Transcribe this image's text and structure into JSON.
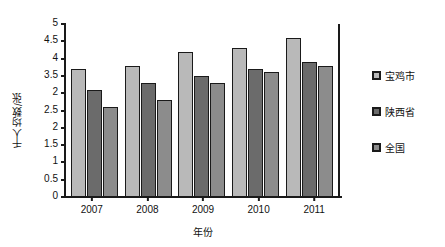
{
  "chart_data": {
    "type": "bar",
    "title": "",
    "xlabel": "年份",
    "ylabel": "千人均数/张",
    "categories": [
      "2007",
      "2008",
      "2009",
      "2010",
      "2011"
    ],
    "series": [
      {
        "name": "宝鸡市",
        "color": "#b9b9b9",
        "values": [
          3.7,
          3.8,
          4.2,
          4.3,
          4.6
        ]
      },
      {
        "name": "陕西省",
        "color": "#6b6b6b",
        "values": [
          3.1,
          3.3,
          3.5,
          3.7,
          3.9
        ]
      },
      {
        "name": "全国",
        "color": "#8c8c8c",
        "values": [
          2.6,
          2.8,
          3.3,
          3.6,
          3.8
        ]
      }
    ],
    "ylim": [
      0,
      5
    ],
    "ytick_values": [
      5,
      4.5,
      4,
      3.5,
      3,
      2.5,
      2,
      1.5,
      1,
      0.5,
      0
    ],
    "ytick_labels": [
      "5",
      "4.5",
      "4",
      "3.5",
      "2",
      "2.5",
      "2",
      "1.5",
      "1",
      "0.5",
      "0"
    ],
    "grid": false,
    "legend_position": "right"
  },
  "axis": {
    "line_color": "#1a1a1a"
  }
}
